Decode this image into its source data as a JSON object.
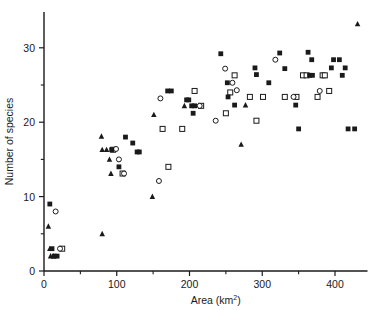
{
  "figure": {
    "background_color": "#ffffff",
    "ink_color": "#1a1a1a"
  },
  "chart_data": {
    "type": "scatter",
    "title": "",
    "xlabel": "Area (km2)",
    "xlabel_base": "Area (km",
    "xlabel_sup": "2",
    "xlabel_close": ")",
    "ylabel": "Number of species",
    "xlim": [
      0,
      445
    ],
    "ylim": [
      0,
      34.5
    ],
    "xticks": [
      0,
      100,
      200,
      300,
      400
    ],
    "xtick_labels": [
      "0",
      "100",
      "200",
      "300",
      "400"
    ],
    "xminor_ticks": [
      50,
      150,
      250,
      350
    ],
    "yticks": [
      0,
      10,
      20,
      30
    ],
    "ytick_labels": [
      "0",
      "10",
      "20",
      "30"
    ],
    "yminor_ticks": [
      5,
      15,
      25
    ],
    "grid": false,
    "legend": "none",
    "marker_kinds": [
      {
        "key": "filled_square",
        "label": "filled square",
        "color": "#1a1a1a"
      },
      {
        "key": "open_square",
        "label": "open square",
        "color": "#1a1a1a"
      },
      {
        "key": "open_circle",
        "label": "open circle",
        "color": "#1a1a1a"
      },
      {
        "key": "filled_triangle",
        "label": "filled triangle",
        "color": "#1a1a1a"
      }
    ],
    "series": [
      {
        "name": "filled square",
        "marker": "filled_square",
        "points": [
          [
            93,
            16.3
          ],
          [
            112,
            18.0
          ],
          [
            122,
            17.2
          ],
          [
            128,
            16.0
          ],
          [
            131,
            16.0
          ],
          [
            103,
            14.0
          ],
          [
            170,
            24.2
          ],
          [
            175,
            24.2
          ],
          [
            203,
            22.2
          ],
          [
            207,
            22.2
          ],
          [
            205,
            21.2
          ],
          [
            196,
            23.0
          ],
          [
            199,
            23.0
          ],
          [
            243,
            29.2
          ],
          [
            252,
            25.3
          ],
          [
            253,
            23.4
          ],
          [
            262,
            22.3
          ],
          [
            290,
            27.3
          ],
          [
            292,
            26.4
          ],
          [
            309,
            25.3
          ],
          [
            324,
            29.3
          ],
          [
            331,
            27.2
          ],
          [
            346,
            22.3
          ],
          [
            350,
            19.1
          ],
          [
            363,
            29.4
          ],
          [
            368,
            28.4
          ],
          [
            365,
            26.3
          ],
          [
            369,
            26.3
          ],
          [
            395,
            27.3
          ],
          [
            398,
            28.4
          ],
          [
            406,
            28.4
          ],
          [
            410,
            26.3
          ],
          [
            414,
            27.3
          ],
          [
            418,
            19.1
          ],
          [
            427,
            19.1
          ],
          [
            8,
            9.0
          ],
          [
            11,
            3.0
          ],
          [
            14,
            2.0
          ],
          [
            18,
            2.0
          ]
        ]
      },
      {
        "name": "open square",
        "marker": "open_square",
        "points": [
          [
            95,
            16.3
          ],
          [
            108,
            13.1
          ],
          [
            163,
            19.1
          ],
          [
            190,
            19.1
          ],
          [
            207,
            24.2
          ],
          [
            216,
            22.2
          ],
          [
            250,
            21.2
          ],
          [
            256,
            24.0
          ],
          [
            262,
            26.3
          ],
          [
            283,
            23.4
          ],
          [
            301,
            23.4
          ],
          [
            292,
            20.2
          ],
          [
            331,
            23.4
          ],
          [
            347,
            23.4
          ],
          [
            356,
            26.3
          ],
          [
            361,
            26.3
          ],
          [
            383,
            26.3
          ],
          [
            386,
            26.3
          ],
          [
            376,
            23.4
          ],
          [
            392,
            24.2
          ],
          [
            25,
            3.0
          ],
          [
            171,
            14.0
          ]
        ]
      },
      {
        "name": "open circle",
        "marker": "open_circle",
        "points": [
          [
            99,
            16.4
          ],
          [
            103,
            15.0
          ],
          [
            110,
            13.1
          ],
          [
            160,
            23.2
          ],
          [
            158,
            12.1
          ],
          [
            214,
            22.2
          ],
          [
            236,
            20.2
          ],
          [
            249,
            27.2
          ],
          [
            259,
            25.3
          ],
          [
            265,
            24.3
          ],
          [
            318,
            28.4
          ],
          [
            343,
            23.4
          ],
          [
            379,
            24.2
          ],
          [
            16,
            8.0
          ],
          [
            22,
            3.0
          ]
        ]
      },
      {
        "name": "filled triangle",
        "marker": "filled_triangle",
        "points": [
          [
            80,
            16.3
          ],
          [
            86,
            16.3
          ],
          [
            79,
            18.1
          ],
          [
            90,
            15.0
          ],
          [
            92,
            13.1
          ],
          [
            151,
            21.0
          ],
          [
            149,
            10.0
          ],
          [
            193,
            22.2
          ],
          [
            271,
            17.0
          ],
          [
            277,
            22.3
          ],
          [
            431,
            33.2
          ],
          [
            80,
            5.0
          ],
          [
            6,
            6.0
          ],
          [
            8,
            3.0
          ],
          [
            9,
            2.0
          ],
          [
            13,
            2.0
          ]
        ]
      }
    ]
  }
}
